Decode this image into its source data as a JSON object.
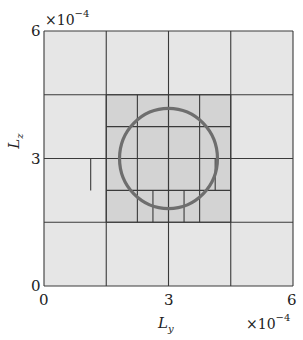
{
  "chart_data": {
    "type": "diagram",
    "title": "",
    "xlabel": "L_y",
    "ylabel": "L_z",
    "x_exponent": "×10^-4",
    "y_exponent": "×10^-4",
    "xlim": [
      0,
      6
    ],
    "ylim": [
      0,
      6
    ],
    "x_ticks": [
      "0",
      "3",
      "6"
    ],
    "y_ticks": [
      "0",
      "3",
      "6"
    ],
    "grid": false,
    "colors": {
      "coarse_cell": "#e6e6e6",
      "refined_cell": "#d3d3d3",
      "cell_border": "#3a3a3a",
      "circle": "#6e6e6e"
    },
    "coarse_grid_lines": [
      0,
      1.5,
      3,
      4.5,
      6
    ],
    "refined_region": {
      "x": [
        1.5,
        4.5
      ],
      "y": [
        1.5,
        4.5
      ],
      "lines": [
        1.5,
        2.25,
        3,
        3.75,
        4.5
      ]
    },
    "fine_subdivisions": [
      {
        "x": 1.125,
        "y": [
          2.25,
          3.0
        ]
      },
      {
        "x": 4.125,
        "y": [
          2.25,
          3.0
        ]
      },
      {
        "x": 2.625,
        "y": [
          1.5,
          2.25
        ]
      },
      {
        "x": 3.375,
        "y": [
          1.5,
          2.25
        ]
      }
    ],
    "circle": {
      "cx": 3.0,
      "cy": 3.0,
      "r": 1.18
    }
  },
  "labels": {
    "x_tick_0": "0",
    "x_tick_3": "3",
    "x_tick_6": "6",
    "y_tick_0": "0",
    "y_tick_3": "3",
    "y_tick_6": "6",
    "exp_base": "×10",
    "exp_power": "−4",
    "xlabel_main": "L",
    "xlabel_sub": "y",
    "ylabel_main": "L",
    "ylabel_sub": "z"
  }
}
